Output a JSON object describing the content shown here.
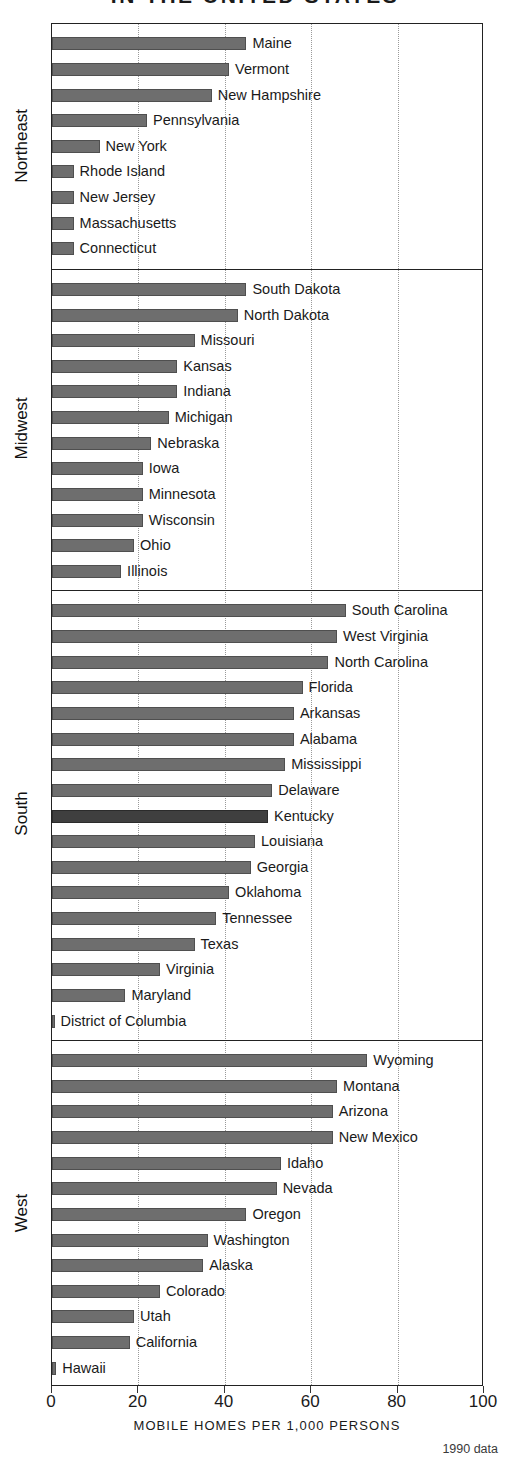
{
  "title": "IN THE UNITED STATES",
  "axis": {
    "title": "MOBILE HOMES PER 1,000 PERSONS",
    "ticks": [
      0,
      20,
      40,
      60,
      80,
      100
    ],
    "min": 0,
    "max": 100
  },
  "source_note": "1990 data",
  "colors": {
    "bar": "#6e6e6e",
    "bar_border": "#4f4f4f",
    "bar_highlight": "#3f3f3f",
    "frame": "#222222",
    "gridline": "#9a9a9a",
    "text": "#1a1a1a"
  },
  "chart_data": {
    "type": "bar",
    "orientation": "horizontal",
    "title": "IN THE UNITED STATES",
    "xlabel": "MOBILE HOMES PER 1,000 PERSONS",
    "ylabel": "",
    "xlim": [
      0,
      100
    ],
    "xticks": [
      0,
      20,
      40,
      60,
      80,
      100
    ],
    "grid": "vertical-dotted",
    "legend": "none",
    "note": "1990 data",
    "highlighted": [
      "Kentucky"
    ],
    "groups": [
      {
        "name": "Northeast",
        "categories": [
          "Maine",
          "Vermont",
          "New Hampshire",
          "Pennsylvania",
          "New York",
          "Rhode Island",
          "New Jersey",
          "Massachusetts",
          "Connecticut"
        ],
        "values": [
          45,
          41,
          37,
          22,
          11,
          5,
          5,
          5,
          5
        ]
      },
      {
        "name": "Midwest",
        "categories": [
          "South Dakota",
          "North Dakota",
          "Missouri",
          "Kansas",
          "Indiana",
          "Michigan",
          "Nebraska",
          "Iowa",
          "Minnesota",
          "Wisconsin",
          "Ohio",
          "Illinois"
        ],
        "values": [
          45,
          43,
          33,
          29,
          29,
          27,
          23,
          21,
          21,
          21,
          19,
          16
        ]
      },
      {
        "name": "South",
        "categories": [
          "South Carolina",
          "West Virginia",
          "North Carolina",
          "Florida",
          "Arkansas",
          "Alabama",
          "Mississippi",
          "Delaware",
          "Kentucky",
          "Louisiana",
          "Georgia",
          "Oklahoma",
          "Tennessee",
          "Texas",
          "Virginia",
          "Maryland",
          "District of Columbia"
        ],
        "values": [
          68,
          66,
          64,
          58,
          56,
          56,
          54,
          51,
          50,
          47,
          46,
          41,
          38,
          33,
          25,
          17,
          0.5
        ]
      },
      {
        "name": "West",
        "categories": [
          "Wyoming",
          "Montana",
          "Arizona",
          "New Mexico",
          "Idaho",
          "Nevada",
          "Oregon",
          "Washington",
          "Alaska",
          "Colorado",
          "Utah",
          "California",
          "Hawaii"
        ],
        "values": [
          73,
          66,
          65,
          65,
          53,
          52,
          45,
          36,
          35,
          25,
          19,
          18,
          1
        ]
      }
    ]
  }
}
